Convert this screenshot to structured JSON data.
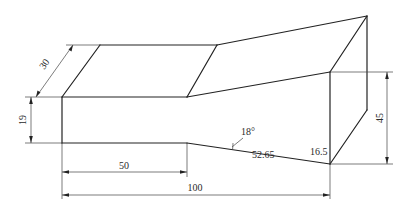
{
  "diagram": {
    "type": "isometric-technical-drawing",
    "colors": {
      "background": "#ffffff",
      "lines": "#222222",
      "text": "#2a2a2a"
    },
    "dimensions": {
      "depth": {
        "label": "30"
      },
      "front_height_left": {
        "label": "19"
      },
      "step_length": {
        "label": "50"
      },
      "total_length": {
        "label": "100"
      },
      "right_height": {
        "label": "45"
      },
      "slope_angle": {
        "label": "18°"
      },
      "slope_length": {
        "label": "52.65"
      },
      "drop_at_right": {
        "label": "16.5"
      }
    }
  }
}
